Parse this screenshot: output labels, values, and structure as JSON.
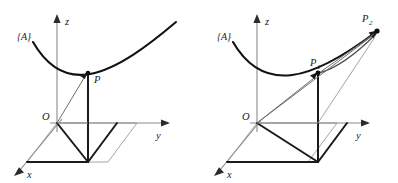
{
  "figure": {
    "background_color": "#ffffff",
    "stroke_color": "#1a1a1a",
    "axis_color": "#8a8a8a",
    "panels": [
      {
        "id": "left-panel",
        "name": "single-point-panel",
        "frame_label": "{A}",
        "origin_label": "O",
        "axis_labels": {
          "x": "x",
          "y": "y",
          "z": "z"
        },
        "points": [
          {
            "id": "P",
            "label": "P",
            "subscript": ""
          }
        ],
        "description": "Point P on curve with position vector from origin O"
      },
      {
        "id": "right-panel",
        "name": "two-point-panel",
        "frame_label": "{A}",
        "origin_label": "O",
        "axis_labels": {
          "x": "x",
          "y": "y",
          "z": "z"
        },
        "points": [
          {
            "id": "P1",
            "label": "P",
            "subscript": "1"
          },
          {
            "id": "P2",
            "label": "P",
            "subscript": "2"
          }
        ],
        "description": "Points P1 and P2 on curve with position vectors from origin O"
      }
    ]
  }
}
